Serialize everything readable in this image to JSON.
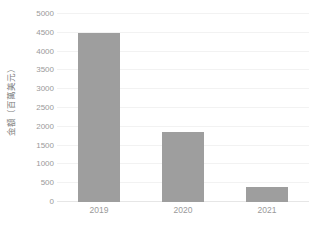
{
  "chart_data": {
    "type": "bar",
    "title": "",
    "xlabel": "",
    "ylabel": "金額（百萬美元）",
    "categories": [
      "2019",
      "2020",
      "2021"
    ],
    "values": [
      4500,
      1850,
      400
    ],
    "series": [
      {
        "name": "金額（百萬美元）",
        "values": [
          4500,
          1850,
          400
        ]
      }
    ],
    "ylim": [
      0,
      5000
    ],
    "ytick_labels": [
      "0",
      "500",
      "1000",
      "1500",
      "2000",
      "2500",
      "3000",
      "3500",
      "4000",
      "4500",
      "5000"
    ],
    "ytick_values": [
      0,
      500,
      1000,
      1500,
      2000,
      2500,
      3000,
      3500,
      4000,
      4500,
      5000
    ],
    "grid": true,
    "legend": false,
    "legend_position": "none",
    "colors": {
      "bar": "#9e9e9e",
      "gridline": "#f2f2f2",
      "axis": "#e6e6e6",
      "tick_text": "#9a9a9a",
      "axis_title_text": "#7d7d7d",
      "background": "#ffffff"
    }
  }
}
